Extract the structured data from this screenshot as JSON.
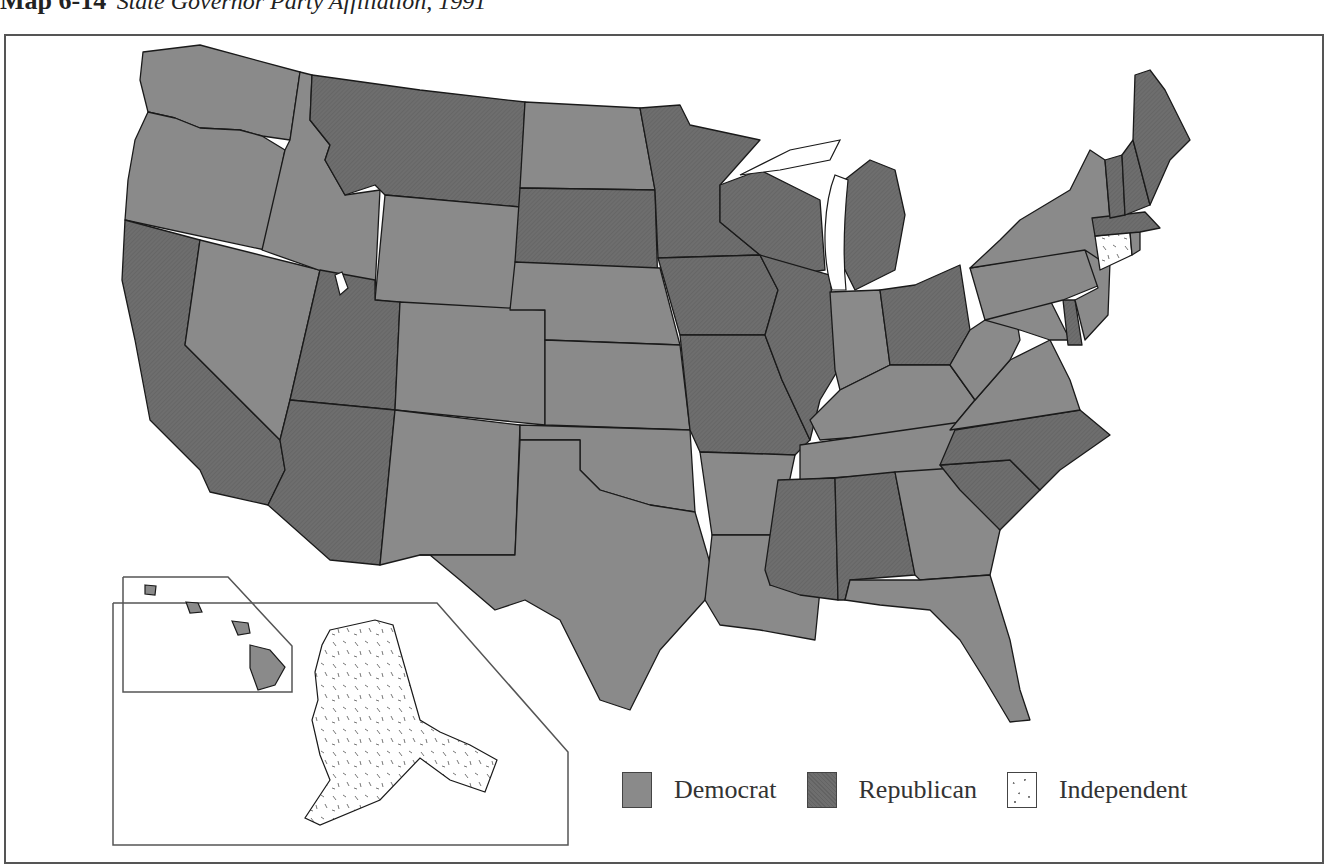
{
  "title": {
    "number": "Map 6-14",
    "subtitle": "State Governor Party Affiliation, 1991"
  },
  "legend": [
    {
      "key": "democrat",
      "label": "Democrat",
      "color": "#8a8a8a"
    },
    {
      "key": "republican",
      "label": "Republican",
      "color": "#6e6e6e"
    },
    {
      "key": "independent",
      "label": "Independent",
      "color": "#ffffff"
    }
  ],
  "colors": {
    "democrat": "#8a8a8a",
    "republican": "#6e6e6e",
    "independent": "#ffffff",
    "border": "#1a1a1a",
    "frame": "#555555"
  },
  "states": {
    "WA": "democrat",
    "OR": "democrat",
    "CA": "republican",
    "NV": "democrat",
    "ID": "democrat",
    "MT": "republican",
    "WY": "democrat",
    "UT": "republican",
    "AZ": "republican",
    "CO": "democrat",
    "NM": "democrat",
    "ND": "democrat",
    "SD": "republican",
    "NE": "democrat",
    "KS": "democrat",
    "OK": "democrat",
    "TX": "democrat",
    "MN": "republican",
    "IA": "republican",
    "MO": "republican",
    "AR": "democrat",
    "LA": "democrat",
    "WI": "republican",
    "IL": "republican",
    "MI": "republican",
    "IN": "democrat",
    "OH": "republican",
    "KY": "democrat",
    "TN": "democrat",
    "MS": "republican",
    "AL": "republican",
    "GA": "democrat",
    "FL": "democrat",
    "SC": "republican",
    "NC": "republican",
    "VA": "democrat",
    "WV": "democrat",
    "MD": "democrat",
    "DE": "republican",
    "PA": "democrat",
    "NJ": "democrat",
    "NY": "democrat",
    "CT": "independent",
    "RI": "democrat",
    "MA": "republican",
    "VT": "republican",
    "NH": "republican",
    "ME": "republican",
    "AK": "independent",
    "HI": "democrat"
  }
}
